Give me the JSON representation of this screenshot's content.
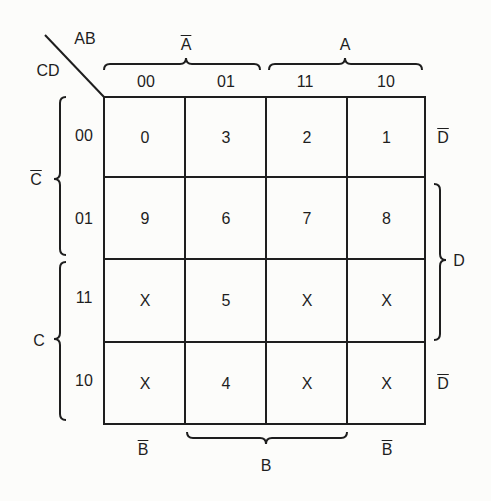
{
  "corner": {
    "row_vars": "AB",
    "col_vars": "CD"
  },
  "top_groups": [
    {
      "label": "A",
      "overline": true
    },
    {
      "label": "A",
      "overline": false
    }
  ],
  "column_headers": [
    "00",
    "01",
    "11",
    "10"
  ],
  "row_headers": [
    "00",
    "01",
    "11",
    "10"
  ],
  "left_groups": [
    {
      "label": "C",
      "overline": true
    },
    {
      "label": "C",
      "overline": false
    }
  ],
  "right_labels": [
    {
      "label": "D",
      "overline": true
    },
    {
      "label": "D",
      "overline": false
    },
    {
      "label": "D",
      "overline": true
    }
  ],
  "bottom_labels": [
    {
      "label": "B",
      "overline": true
    },
    {
      "label": "B",
      "overline": false
    },
    {
      "label": "B",
      "overline": true
    }
  ],
  "cells": [
    [
      "0",
      "3",
      "2",
      "1"
    ],
    [
      "9",
      "6",
      "7",
      "8"
    ],
    [
      "X",
      "5",
      "X",
      "X"
    ],
    [
      "X",
      "4",
      "X",
      "X"
    ]
  ],
  "colors": {
    "line": "#1e1e1e",
    "background": "#fcfcfa"
  }
}
